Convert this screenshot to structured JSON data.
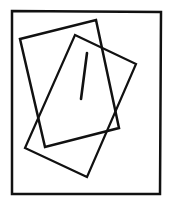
{
  "canvas": {
    "width": 169,
    "height": 202,
    "background": "#ffffff"
  },
  "stroke_color": "#111111",
  "frame": {
    "points": "12,11 161,12 160,194 12,194",
    "stroke_width": 2.5
  },
  "rect_a": {
    "points": "20,39 96,20 119,128 45,147",
    "stroke_width": 2.5
  },
  "rect_b": {
    "points": "75,35 136,64 87,177 25,148",
    "stroke_width": 2.2
  },
  "mark": {
    "x1": 87,
    "y1": 53,
    "x2": 81,
    "y2": 99,
    "stroke_width": 2.6
  }
}
